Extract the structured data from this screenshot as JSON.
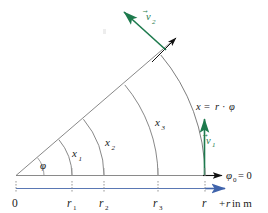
{
  "figure": {
    "colors": {
      "arc": "#6f6f6f",
      "radius_line": "#6f6f6f",
      "baseline": "#808080",
      "axis": "#5a78b4",
      "vector_green": "#1d7a4d",
      "arrow_black": "#111111",
      "text": "#1a1a1a"
    },
    "angle_label": "φ",
    "arc_labels": [
      {
        "name": "x1",
        "base": "x",
        "sub": "1"
      },
      {
        "name": "x2",
        "base": "x",
        "sub": "2"
      },
      {
        "name": "x3",
        "base": "x",
        "sub": "3"
      }
    ],
    "arc_length_label": {
      "text": "x = r · φ",
      "parts": {
        "x": "x",
        "equals": "=",
        "r": "r",
        "dot": "·",
        "phi": "φ"
      }
    },
    "vectors": [
      {
        "name": "v1",
        "base": "v",
        "sub": "1",
        "accent": "⃗"
      },
      {
        "name": "v2",
        "base": "v",
        "sub": "2",
        "accent": "⃗"
      }
    ],
    "reference_angle_label": {
      "base": "φ",
      "sub": "0",
      "equals": "= 0"
    },
    "axis": {
      "label": "+r in m",
      "label_italic_part": "r",
      "label_prefix": "+",
      "label_suffix": " in m",
      "ticks": [
        {
          "name": "origin",
          "base": "0",
          "sub": ""
        },
        {
          "name": "r1",
          "base": "r",
          "sub": "1"
        },
        {
          "name": "r2",
          "base": "r",
          "sub": "2"
        },
        {
          "name": "r3",
          "base": "r",
          "sub": "3"
        },
        {
          "name": "r",
          "base": "r",
          "sub": ""
        }
      ]
    }
  }
}
